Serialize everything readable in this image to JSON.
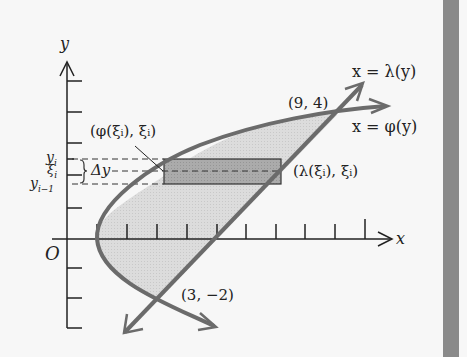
{
  "diagram": {
    "axes": {
      "x_label": "x",
      "y_label": "y",
      "origin_label": "O",
      "x_ticks": [
        1,
        2,
        3,
        4,
        5,
        6,
        7,
        8,
        9,
        10
      ],
      "y_ticks": [
        -3,
        -2,
        -1,
        1,
        2,
        3,
        4,
        5
      ]
    },
    "curves": [
      {
        "name": "lambda",
        "label": "x = λ(y)",
        "type": "line"
      },
      {
        "name": "phi",
        "label": "x = φ(y)",
        "type": "parabola"
      }
    ],
    "points": [
      {
        "label": "(9, 4)",
        "x": 9,
        "y": 4
      },
      {
        "label": "(3, −2)",
        "x": 3,
        "y": -2
      }
    ],
    "strip_labels": {
      "left_point": "(φ(ξᵢ), ξᵢ)",
      "right_point": "(λ(ξᵢ), ξᵢ)",
      "delta": "Δy",
      "y_i": "y",
      "y_i_sub": "i",
      "xi_i": "ξ",
      "xi_i_sub": "i",
      "y_im1": "y",
      "y_im1_sub": "i−1"
    },
    "colors": {
      "curve": "#6b6b6b",
      "region_fill": "#d9d9d9",
      "strip_fill": "#a9a9a9",
      "axis": "#222222",
      "side_bar": "#8a8a8a"
    }
  }
}
